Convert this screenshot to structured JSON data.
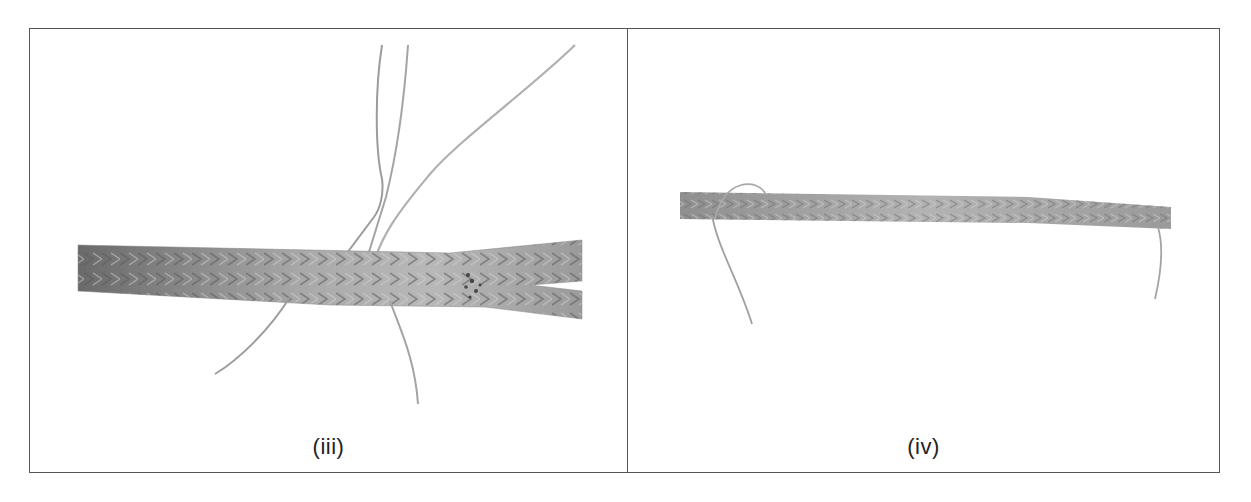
{
  "figure": {
    "panels": [
      {
        "id": "iii",
        "label": "(iii)",
        "subject": "braided rope with loose strands, split end at right"
      },
      {
        "id": "iv",
        "label": "(iv)",
        "subject": "thin braided rope with loose strand ends"
      }
    ],
    "colors": {
      "border": "#555555",
      "rope_dark": "#6e6e6e",
      "rope_light": "#b5b5b5",
      "strand": "#a8a8a8"
    }
  }
}
